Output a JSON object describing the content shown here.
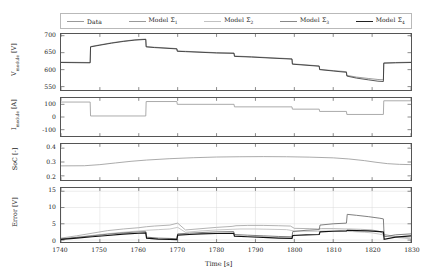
{
  "legend": {
    "position": "top",
    "entries": [
      {
        "label": "Data",
        "icon": "line-swatch",
        "color": "#9a9a9a",
        "width": 0.9
      },
      {
        "label": "Model Σ",
        "sub": "1",
        "icon": "line-swatch",
        "color": "#9a9a9a",
        "width": 0.9
      },
      {
        "label": "Model Σ",
        "sub": "2",
        "icon": "line-swatch",
        "color": "#b5b5b5",
        "width": 0.9
      },
      {
        "label": "Model Σ",
        "sub": "3",
        "icon": "line-swatch",
        "color": "#777777",
        "width": 0.9
      },
      {
        "label": "Model Σ",
        "sub": "4",
        "icon": "line-swatch",
        "color": "#222222",
        "width": 1.1
      }
    ]
  },
  "axis": {
    "xlabel": "Time [s]",
    "xlim": [
      1740,
      1830
    ],
    "xticks": [
      1740,
      1750,
      1760,
      1770,
      1780,
      1790,
      1800,
      1810,
      1820,
      1830
    ],
    "xticklabels": [
      "1740",
      "1750",
      "1760",
      "1770",
      "1780",
      "1790",
      "1800",
      "1810",
      "1820",
      "1830"
    ]
  },
  "chart_data": [
    {
      "type": "line",
      "name": "voltage",
      "title": "",
      "xlabel": "",
      "ylabel": "V_module [V]",
      "ylabel_display": "V",
      "ylabel_sub": "module",
      "ylabel_unit": "[V]",
      "xlim": [
        1740,
        1830
      ],
      "ylim": [
        540,
        705
      ],
      "yticks": [
        700,
        650,
        600,
        550
      ],
      "yticklabels": [
        "700",
        "650",
        "600",
        "550"
      ],
      "grid": false,
      "series": [
        {
          "name": "Data",
          "color": "#8d8d8d",
          "width": 0.9,
          "x": [
            1740,
            1747.5,
            1747.6,
            1750,
            1753,
            1756,
            1759,
            1761.8,
            1761.9,
            1764,
            1767,
            1769.8,
            1769.9,
            1772,
            1776,
            1780,
            1784.5,
            1784.6,
            1789,
            1794,
            1799.4,
            1799.5,
            1803,
            1806.4,
            1806.5,
            1810,
            1813.4,
            1813.5,
            1816,
            1819,
            1821.5,
            1822.9,
            1823.0,
            1826,
            1830
          ],
          "y": [
            622,
            621,
            668,
            673,
            679,
            684,
            688,
            690,
            668,
            666,
            664,
            662,
            655,
            654,
            652,
            650,
            649,
            640,
            638,
            635,
            632,
            617,
            614,
            611,
            601,
            597,
            594,
            583,
            578,
            574,
            571,
            570,
            620,
            621,
            622
          ]
        },
        {
          "name": "Model Σ4",
          "color": "#2a2a2a",
          "width": 0.8,
          "x": [
            1740,
            1747.5,
            1747.6,
            1750,
            1753,
            1756,
            1759,
            1761.8,
            1761.9,
            1764,
            1767,
            1769.8,
            1769.9,
            1772,
            1776,
            1780,
            1784.5,
            1784.6,
            1789,
            1794,
            1799.4,
            1799.5,
            1803,
            1806.4,
            1806.5,
            1810,
            1813.4,
            1813.5,
            1816,
            1819,
            1821.5,
            1822.9,
            1823.0,
            1826,
            1830
          ],
          "y": [
            621,
            620,
            667,
            672,
            678,
            683,
            687,
            689,
            667,
            665,
            663,
            661,
            654,
            653,
            651,
            649,
            648,
            639,
            637,
            634,
            631,
            616,
            613,
            610,
            600,
            596,
            592,
            581,
            575,
            570,
            566,
            565,
            619,
            620,
            621
          ]
        }
      ]
    },
    {
      "type": "line",
      "name": "current",
      "ylabel": "I_module [A]",
      "ylabel_display": "I",
      "ylabel_sub": "module",
      "ylabel_unit": "[A]",
      "xlim": [
        1740,
        1830
      ],
      "ylim": [
        -150,
        150
      ],
      "yticks": [
        100,
        0,
        -100
      ],
      "yticklabels": [
        "100",
        "0",
        "-100"
      ],
      "grid": false,
      "series": [
        {
          "name": "Data",
          "color": "#9e9e9e",
          "width": 0.9,
          "x": [
            1740,
            1747.5,
            1747.6,
            1761.8,
            1761.9,
            1769.8,
            1769.9,
            1784.5,
            1784.6,
            1799.4,
            1799.5,
            1806.4,
            1806.5,
            1813.4,
            1813.5,
            1822.9,
            1823.0,
            1830
          ],
          "y": [
            118,
            118,
            8,
            8,
            122,
            122,
            100,
            100,
            80,
            80,
            62,
            62,
            44,
            44,
            20,
            20,
            128,
            128
          ]
        }
      ]
    },
    {
      "type": "line",
      "name": "soc",
      "ylabel": "SoC [-]",
      "ylabel_display": "SoC [-]",
      "xlim": [
        1740,
        1830
      ],
      "ylim": [
        0.17,
        0.43
      ],
      "yticks": [
        0.4,
        0.3,
        0.2
      ],
      "yticklabels": [
        "0.4",
        "0.3",
        "0.2"
      ],
      "grid": false,
      "series": [
        {
          "name": "Data",
          "color": "#9e9e9e",
          "width": 0.9,
          "x": [
            1740,
            1746,
            1750,
            1754,
            1758,
            1762,
            1768,
            1774,
            1780,
            1786,
            1792,
            1798,
            1804,
            1810,
            1814,
            1818,
            1821,
            1824,
            1827,
            1830
          ],
          "y": [
            0.272,
            0.273,
            0.281,
            0.293,
            0.305,
            0.314,
            0.324,
            0.331,
            0.336,
            0.338,
            0.339,
            0.338,
            0.335,
            0.33,
            0.322,
            0.31,
            0.298,
            0.288,
            0.283,
            0.281
          ]
        }
      ]
    },
    {
      "type": "line",
      "name": "error",
      "ylabel": "Error [V]",
      "ylabel_display": "Error [V]",
      "xlim": [
        1740,
        1830
      ],
      "ylim": [
        -0.6,
        16
      ],
      "yticks": [
        15,
        10,
        5,
        0
      ],
      "yticklabels": [
        "15",
        "10",
        "5",
        "0"
      ],
      "grid": true,
      "series": [
        {
          "name": "Model Σ1",
          "color": "#a8a8a8",
          "width": 0.9,
          "x": [
            1740,
            1744,
            1748,
            1752,
            1756,
            1760,
            1762,
            1764,
            1768,
            1770,
            1772,
            1776,
            1780,
            1784,
            1785,
            1788,
            1792,
            1796,
            1799,
            1800,
            1804,
            1806,
            1807,
            1810,
            1813,
            1814,
            1817,
            1820,
            1822,
            1823,
            1826,
            1830
          ],
          "y": [
            0.6,
            1.3,
            2.1,
            2.9,
            3.4,
            3.8,
            4.1,
            4.3,
            4.6,
            5.2,
            3.1,
            3.5,
            3.9,
            4.2,
            4.4,
            4.5,
            4.5,
            4.4,
            4.3,
            3.6,
            3.5,
            3.4,
            3.5,
            3.5,
            3.4,
            3.4,
            3.3,
            3.1,
            2.6,
            1.8,
            1.0,
            0.6
          ]
        },
        {
          "name": "Model Σ2",
          "color": "#bfbfbf",
          "width": 0.9,
          "x": [
            1740,
            1745,
            1750,
            1755,
            1760,
            1762,
            1765,
            1768,
            1770,
            1772,
            1776,
            1780,
            1784,
            1786,
            1790,
            1794,
            1798,
            1800,
            1803,
            1806,
            1808,
            1811,
            1813,
            1815,
            1818,
            1820,
            1822,
            1824,
            1827,
            1830
          ],
          "y": [
            0.4,
            1.0,
            1.7,
            2.3,
            2.8,
            3.0,
            3.2,
            3.4,
            3.9,
            2.4,
            2.8,
            3.1,
            3.3,
            3.4,
            3.4,
            3.3,
            3.2,
            2.8,
            2.7,
            2.7,
            2.8,
            2.8,
            2.7,
            2.6,
            2.4,
            2.2,
            1.8,
            1.2,
            0.7,
            0.4
          ]
        },
        {
          "name": "Model Σ3",
          "color": "#6e6e6e",
          "width": 0.9,
          "x": [
            1740,
            1744,
            1748,
            1752,
            1756,
            1760,
            1761.8,
            1762,
            1765,
            1768,
            1769.8,
            1770,
            1773,
            1776,
            1780,
            1784.4,
            1784.6,
            1788,
            1792,
            1796,
            1799.4,
            1799.6,
            1803,
            1806.4,
            1806.6,
            1810,
            1813.4,
            1813.6,
            1816,
            1819,
            1822,
            1822.9,
            1823.1,
            1826,
            1830
          ],
          "y": [
            0.3,
            0.8,
            1.3,
            1.8,
            2.2,
            2.5,
            2.6,
            0.9,
            0.6,
            0.5,
            0.4,
            1.9,
            2.1,
            2.3,
            2.5,
            2.6,
            1.7,
            1.5,
            1.3,
            1.1,
            1.0,
            2.6,
            3.0,
            3.2,
            4.6,
            5.0,
            5.2,
            7.9,
            7.6,
            7.2,
            6.7,
            6.5,
            1.0,
            1.6,
            1.9
          ]
        },
        {
          "name": "Model Σ4",
          "color": "#111111",
          "width": 1.2,
          "x": [
            1740,
            1744,
            1748,
            1752,
            1756,
            1760,
            1761.8,
            1762,
            1765,
            1768,
            1769.8,
            1770,
            1773,
            1776,
            1780,
            1784.4,
            1784.6,
            1788,
            1792,
            1796,
            1799.4,
            1799.6,
            1803,
            1806.4,
            1806.6,
            1810,
            1813.4,
            1813.6,
            1816,
            1819,
            1822,
            1822.9,
            1823.1,
            1826,
            1830
          ],
          "y": [
            0.2,
            0.6,
            1.0,
            1.4,
            1.8,
            2.1,
            2.2,
            0.6,
            0.3,
            0.2,
            0.15,
            1.5,
            1.7,
            1.9,
            2.0,
            2.1,
            1.2,
            1.0,
            0.8,
            0.6,
            0.5,
            1.4,
            1.6,
            1.7,
            2.5,
            2.7,
            2.8,
            3.0,
            2.9,
            2.8,
            2.6,
            2.5,
            0.2,
            0.9,
            1.3
          ]
        }
      ]
    }
  ]
}
